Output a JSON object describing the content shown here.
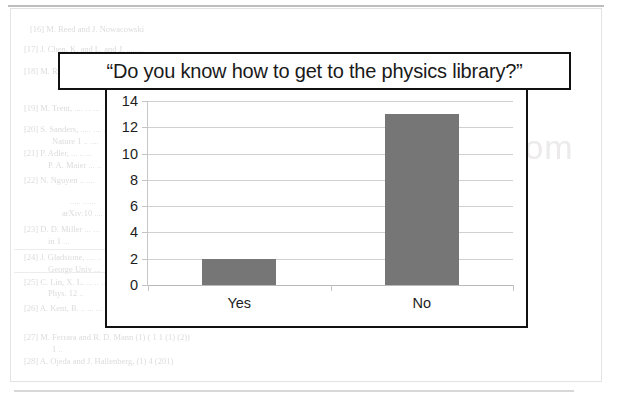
{
  "page": {
    "watermark": ".com",
    "background_lines": [
      {
        "text": "[16]  M. Reed and J. Nowacowski",
        "x": 30,
        "y": 24
      },
      {
        "text": "[17]  J. Chen, K. and L. and J. ........",
        "x": 24,
        "y": 44
      },
      {
        "text": "[18]  M. Rosen ..... ......",
        "x": 24,
        "y": 66
      },
      {
        "text": "[19]  M. Trent, .... ... ...",
        "x": 24,
        "y": 103
      },
      {
        "text": "[20]  S. Sanders, ..... .... ..",
        "x": 24,
        "y": 124
      },
      {
        "text": "Nature 1 .. ....",
        "x": 52,
        "y": 136
      },
      {
        "text": "[21]  P. Adler, ... .. ...",
        "x": 24,
        "y": 148
      },
      {
        "text": "P. A. Maier ... ..",
        "x": 48,
        "y": 160
      },
      {
        "text": "[22]  N.  Nguyen .. ....",
        "x": 24,
        "y": 175
      },
      {
        "text": "..... ......",
        "x": 70,
        "y": 196
      },
      {
        "text": "arXiv:10 ....",
        "x": 62,
        "y": 208
      },
      {
        "text": "[23]  D. D. Miller ... ...",
        "x": 24,
        "y": 224
      },
      {
        "text": "in 1 ...",
        "x": 48,
        "y": 236
      },
      {
        "text": "[24]  J. Gladstone, .... ..",
        "x": 24,
        "y": 252
      },
      {
        "text": "George Univ ...",
        "x": 48,
        "y": 264
      },
      {
        "text": "[25]  C. Lin, X. L. ... .. ..",
        "x": 24,
        "y": 277
      },
      {
        "text": "Phys. 12 ..",
        "x": 48,
        "y": 288
      },
      {
        "text": "[26]  A. Kent, B. .. ... ...",
        "x": 24,
        "y": 303
      },
      {
        "text": "[27]  M. Ferrara and R. D. Mann  (1) ( 1    1   (1)  (2))",
        "x": 24,
        "y": 332
      },
      {
        "text": "1 ..",
        "x": 52,
        "y": 344
      },
      {
        "text": "[28]  A. Ojeda and J. Hallenberg, (1) 4            (201)",
        "x": 24,
        "y": 356
      }
    ],
    "background_rules": [
      {
        "x": 14,
        "y": 249,
        "w": 136
      },
      {
        "x": 14,
        "y": 272,
        "w": 136
      }
    ]
  },
  "chart_data": {
    "type": "bar",
    "title": "“Do you know how to get to the physics library?”",
    "xlabel": "",
    "ylabel": "",
    "categories": [
      "Yes",
      "No"
    ],
    "values": [
      2,
      13
    ],
    "yticks": [
      0,
      2,
      4,
      6,
      8,
      10,
      12,
      14
    ],
    "ylim": [
      0,
      14
    ],
    "grid": true,
    "legend": false,
    "bar_color": "#767676",
    "gridline_color": "#d0d0d0",
    "text_color": "#1d1d1d",
    "border_color": "#111111"
  }
}
